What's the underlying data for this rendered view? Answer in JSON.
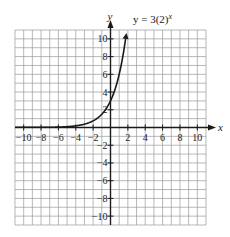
{
  "chart_data": {
    "type": "line",
    "title": "",
    "equation_label": "y = 3(2)ˣ",
    "equation_display": {
      "prefix": "y = 3(2)",
      "exponent": "x"
    },
    "xlabel": "x",
    "ylabel": "y",
    "xlim": [
      -11,
      11
    ],
    "ylim": [
      -11,
      11
    ],
    "grid": true,
    "grid_step": 1,
    "x_ticks": [
      -10,
      -8,
      -6,
      -4,
      -2,
      2,
      4,
      6,
      8,
      10
    ],
    "x_tick_labels": [
      "−10",
      "−8",
      "−6",
      "−4",
      "−2",
      "2",
      "4",
      "6",
      "8",
      "10"
    ],
    "y_ticks": [
      10,
      8,
      6,
      4,
      2,
      -2,
      -4,
      -6,
      -8,
      -10
    ],
    "y_tick_labels": [
      "10",
      "8",
      "6",
      "4",
      "2",
      "−2",
      "−4",
      "−6",
      "−8",
      "−10"
    ],
    "series": [
      {
        "name": "y = 3(2)^x",
        "function": "3*2^x",
        "x": [
          -11,
          -10,
          -8,
          -6,
          -5,
          -4,
          -3,
          -2,
          -1,
          0,
          0.5,
          1,
          1.5,
          1.74
        ],
        "y": [
          0.0015,
          0.003,
          0.012,
          0.047,
          0.094,
          0.1875,
          0.375,
          0.75,
          1.5,
          3,
          4.24,
          6,
          8.49,
          10
        ],
        "arrow_end": true
      }
    ],
    "colors": {
      "grid": "#9a9a9a",
      "axis": "#1a1a1a",
      "curve": "#1a1a1a",
      "background": "#ffffff"
    }
  }
}
